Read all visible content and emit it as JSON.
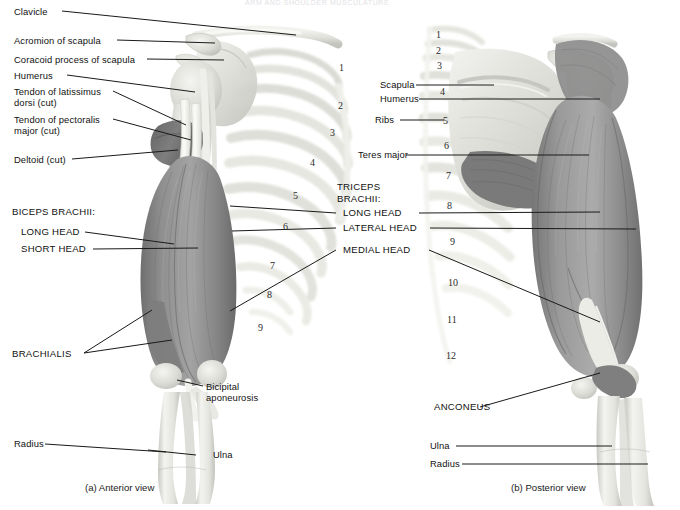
{
  "figure": {
    "header_faint": "ARM AND SHOULDER MUSCULATURE",
    "panels": [
      {
        "id": "a",
        "caption": "(a)  Anterior view"
      },
      {
        "id": "b",
        "caption": "(b)  Posterior view"
      }
    ]
  },
  "anterior_labels": {
    "clavicle": "Clavicle",
    "acromion": "Acromion of scapula",
    "coracoid": "Coracoid process of scapula",
    "humerus": "Humerus",
    "latissimus_l1": "Tendon of latissimus",
    "latissimus_l2": "dorsi (cut)",
    "pectoralis_l1": "Tendon of pectoralis",
    "pectoralis_l2": "major (cut)",
    "deltoid": "Deltoid (cut)",
    "biceps_header": "BICEPS BRACHII:",
    "biceps_long": "LONG HEAD",
    "biceps_short": "SHORT HEAD",
    "brachialis": "BRACHIALIS",
    "bicipital_l1": "Bicipital",
    "bicipital_l2": "aponeurosis",
    "radius": "Radius",
    "ulna": "Ulna"
  },
  "triceps_labels": {
    "header_l1": "TRICEPS",
    "header_l2": "BRACHII:",
    "long_head": "LONG HEAD",
    "lateral_head": "LATERAL HEAD",
    "medial_head": "MEDIAL HEAD"
  },
  "posterior_labels": {
    "scapula": "Scapula",
    "humerus": "Humerus",
    "ribs": "Ribs",
    "teres_major": "Teres major",
    "anconeus": "ANCONEUS",
    "ulna": "Ulna",
    "radius": "Radius"
  },
  "rib_numbers": {
    "anterior": [
      "1",
      "2",
      "3",
      "4",
      "5",
      "6",
      "7",
      "8",
      "9"
    ],
    "posterior": [
      "1",
      "2",
      "3",
      "4",
      "5",
      "6",
      "7",
      "8",
      "9",
      "10",
      "11",
      "12"
    ]
  },
  "colors": {
    "background": "#ffffff",
    "leader_line": "#1a1a1a",
    "label_text": "#111111",
    "muscle_mid": "#8d8d8d",
    "muscle_dark": "#6d6d6d",
    "muscle_light": "#b4b4b4",
    "bone_light": "#ededea",
    "bone_shade": "#cfcfca",
    "tendon": "#f4f4f1"
  }
}
